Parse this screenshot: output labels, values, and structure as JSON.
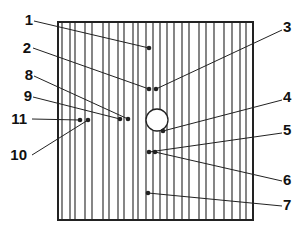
{
  "diagram": {
    "title": "",
    "box": {
      "x": 58,
      "y": 22,
      "width": 195,
      "height": 198
    },
    "vertical_lines_x": [
      62,
      70,
      75,
      85,
      92,
      103,
      109,
      118,
      124,
      133,
      138,
      146,
      153,
      160,
      167,
      174,
      182,
      189,
      199,
      206,
      214,
      224,
      232,
      240,
      246
    ],
    "hole": {
      "cx": 157,
      "cy": 120,
      "r": 11
    },
    "callouts": [
      {
        "label": "1",
        "text_x": 28,
        "text_y": 25,
        "line_from": [
          34,
          21
        ],
        "dot": [
          149,
          48
        ]
      },
      {
        "label": "2",
        "text_x": 26,
        "text_y": 53,
        "line_from": [
          33,
          48
        ],
        "dot": [
          149,
          89
        ]
      },
      {
        "label": "3",
        "text_x": 288,
        "text_y": 32,
        "line_from": [
          282,
          30
        ],
        "dot": [
          156,
          89
        ]
      },
      {
        "label": "4",
        "text_x": 288,
        "text_y": 102,
        "line_from": [
          282,
          100
        ],
        "dot": [
          163,
          131
        ]
      },
      {
        "label": "5",
        "text_x": 288,
        "text_y": 135,
        "line_from": [
          282,
          133
        ],
        "dot": [
          149,
          152
        ]
      },
      {
        "label": "6",
        "text_x": 288,
        "text_y": 185,
        "line_from": [
          282,
          181
        ],
        "dot": [
          155,
          152
        ]
      },
      {
        "label": "7",
        "text_x": 288,
        "text_y": 210,
        "line_from": [
          282,
          206
        ],
        "dot": [
          148,
          193
        ]
      },
      {
        "label": "8",
        "text_x": 28,
        "text_y": 80,
        "line_from": [
          34,
          76
        ],
        "dot": [
          128,
          119
        ]
      },
      {
        "label": "9",
        "text_x": 27,
        "text_y": 101,
        "line_from": [
          33,
          97
        ],
        "dot": [
          120,
          119
        ]
      },
      {
        "label": "10",
        "text_x": 22,
        "text_y": 160,
        "line_from": [
          32,
          155
        ],
        "dot": [
          88,
          120
        ]
      },
      {
        "label": "11",
        "text_x": 22,
        "text_y": 124,
        "line_from": [
          32,
          119
        ],
        "dot": [
          80,
          120
        ]
      }
    ],
    "colors": {
      "stroke": "#222222",
      "background": "#ffffff"
    }
  }
}
